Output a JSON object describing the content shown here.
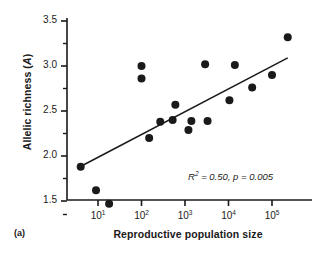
{
  "panel": {
    "label": "(a)"
  },
  "axes": {
    "ylabel_main": "Allelic richness (",
    "ylabel_italic": "A",
    "ylabel_close": ")",
    "xlabel": "Reproductive population size",
    "yticks": [
      "3.5",
      "3.0",
      "2.5",
      "2.0",
      "1.5"
    ],
    "xticks": [
      "10",
      "10",
      "10",
      "10",
      "10"
    ],
    "xtick_exponents": [
      "1",
      "2",
      "3",
      "4",
      "5"
    ]
  },
  "annotation": {
    "r2_symbol": "R",
    "r2_exponent": "2",
    "text": " = 0.50, p =  0.005",
    "full": "R2 = 0.50, p = 0.005"
  },
  "chart_data": {
    "type": "scatter",
    "title": "",
    "xlabel": "Reproductive population size",
    "ylabel": "Allelic richness (A)",
    "xscale": "log",
    "yscale": "linear",
    "xlim": [
      4,
      300000
    ],
    "ylim": [
      1.28,
      3.6
    ],
    "grid": false,
    "legend": null,
    "marker_color": "#1a1a1a",
    "line_color": "#1a1a1a",
    "points": [
      {
        "x": 4,
        "y": 1.88
      },
      {
        "x": 9,
        "y": 1.62
      },
      {
        "x": 18,
        "y": 1.47
      },
      {
        "x": 100,
        "y": 3.0
      },
      {
        "x": 100,
        "y": 2.86
      },
      {
        "x": 150,
        "y": 2.2
      },
      {
        "x": 270,
        "y": 2.38
      },
      {
        "x": 520,
        "y": 2.4
      },
      {
        "x": 600,
        "y": 2.57
      },
      {
        "x": 1200,
        "y": 2.29
      },
      {
        "x": 1400,
        "y": 2.39
      },
      {
        "x": 2900,
        "y": 3.02
      },
      {
        "x": 3300,
        "y": 2.39
      },
      {
        "x": 10500,
        "y": 2.62
      },
      {
        "x": 14000,
        "y": 3.01
      },
      {
        "x": 35000,
        "y": 2.76
      },
      {
        "x": 100000,
        "y": 2.9
      },
      {
        "x": 230000,
        "y": 3.32
      }
    ],
    "trendline": {
      "x_start": 4.6,
      "y_start": 1.9,
      "x_end": 230000,
      "y_end": 3.09,
      "r_squared": 0.5,
      "p_value": 0.005
    }
  }
}
